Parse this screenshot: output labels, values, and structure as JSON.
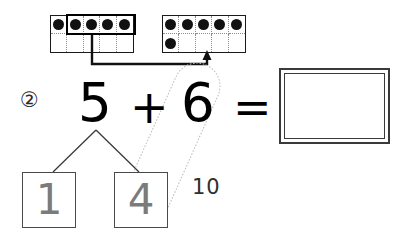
{
  "worksheet": {
    "problem_number": "②",
    "equation": {
      "addend1": "5",
      "operator_plus": "+",
      "addend2": "6",
      "operator_equals": "=",
      "answer_value": ""
    },
    "number_bond": {
      "whole": "5",
      "part_left": "1",
      "part_right": "4"
    },
    "annotation_label": "10",
    "ten_frames": [
      {
        "name": "left-ten-frame",
        "total_dots": 5,
        "rows": [
          [
            1,
            1,
            1,
            1,
            1
          ],
          [
            0,
            0,
            0,
            0,
            0
          ]
        ],
        "grouped_cells": "columns 2-5 of top row"
      },
      {
        "name": "right-ten-frame",
        "total_dots": 6,
        "rows": [
          [
            1,
            1,
            1,
            1,
            1
          ],
          [
            1,
            0,
            0,
            0,
            0
          ]
        ],
        "grouped_cells": ""
      }
    ],
    "colors": {
      "ink": "#111111",
      "pencil_grey": "#7b7b7b",
      "frame_border": "#1a1a1a",
      "light_trace": "#b9b9b9"
    }
  }
}
